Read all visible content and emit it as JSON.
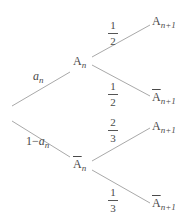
{
  "diagram": {
    "type": "probability-tree",
    "root": {
      "branches": [
        {
          "label": "a",
          "label_sub": "n",
          "node": {
            "letter": "A",
            "sub": "n",
            "complement": false
          },
          "children": [
            {
              "prob_num": "1",
              "prob_den": "2",
              "node": {
                "letter": "A",
                "sub": "n+1",
                "complement": false
              }
            },
            {
              "prob_num": "1",
              "prob_den": "2",
              "node": {
                "letter": "A",
                "sub": "n+1",
                "complement": true
              }
            }
          ]
        },
        {
          "label_prefix": "1−",
          "label": "a",
          "label_sub": "n",
          "node": {
            "letter": "A",
            "sub": "n",
            "complement": true
          },
          "children": [
            {
              "prob_num": "2",
              "prob_den": "3",
              "node": {
                "letter": "A",
                "sub": "n+1",
                "complement": false
              }
            },
            {
              "prob_num": "1",
              "prob_den": "3",
              "node": {
                "letter": "A",
                "sub": "n+1",
                "complement": true
              }
            }
          ]
        }
      ]
    },
    "colors": {
      "line": "#a9a9a9",
      "text": "#4a4a4a"
    }
  }
}
